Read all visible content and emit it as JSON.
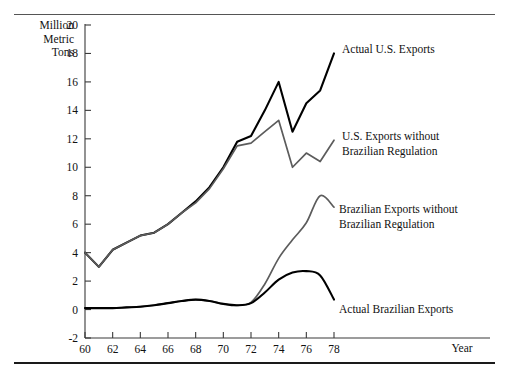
{
  "chart_data": {
    "type": "line",
    "title": "",
    "xlabel": "Year",
    "ylabel": "Million Metric Tons",
    "ylabel_lines": [
      "Million",
      "Metric",
      "Tons"
    ],
    "xlim": [
      60,
      78
    ],
    "ylim": [
      -2,
      20
    ],
    "xticks": [
      60,
      62,
      64,
      66,
      68,
      70,
      72,
      74,
      76,
      78
    ],
    "yticks": [
      -2,
      0,
      2,
      4,
      6,
      8,
      10,
      12,
      14,
      16,
      18,
      20
    ],
    "xtick_labels": [
      "60",
      "62",
      "64",
      "66",
      "68",
      "70",
      "72",
      "74",
      "76",
      "78"
    ],
    "ytick_labels": [
      "-2",
      "0",
      "2",
      "4",
      "6",
      "8",
      "10",
      "12",
      "14",
      "16",
      "18",
      "20"
    ],
    "grid": false,
    "legend_position": "inline-annotations",
    "x": [
      60,
      61,
      62,
      63,
      64,
      65,
      66,
      67,
      68,
      69,
      70,
      71,
      72,
      73,
      74,
      75,
      76,
      77,
      78
    ],
    "series": [
      {
        "name": "Actual U.S. Exports",
        "color": "#000000",
        "style": "solid",
        "width": 2.1,
        "values": [
          4.0,
          3.0,
          4.2,
          4.7,
          5.2,
          5.4,
          6.0,
          6.8,
          7.6,
          8.6,
          10.0,
          11.8,
          12.2,
          14.0,
          16.0,
          12.5,
          14.5,
          15.4,
          18.0
        ]
      },
      {
        "name": "U.S. Exports without Brazilian Regulation",
        "color": "#5c5c5c",
        "style": "solid",
        "width": 1.7,
        "values": [
          4.0,
          3.0,
          4.2,
          4.7,
          5.2,
          5.4,
          6.0,
          6.8,
          7.5,
          8.5,
          9.9,
          11.5,
          11.7,
          12.5,
          13.3,
          10.0,
          11.0,
          10.4,
          11.9
        ]
      },
      {
        "name": "Brazilian Exports without Brazilian Regulation",
        "color": "#5c5c5c",
        "style": "solid",
        "width": 1.7,
        "values": [
          0.1,
          0.1,
          0.1,
          0.15,
          0.2,
          0.3,
          0.45,
          0.6,
          0.7,
          0.6,
          0.4,
          0.3,
          0.5,
          1.8,
          3.6,
          4.9,
          6.1,
          8.0,
          7.2
        ]
      },
      {
        "name": "Actual Brazilian Exports",
        "color": "#000000",
        "style": "solid",
        "width": 2.1,
        "values": [
          0.1,
          0.1,
          0.1,
          0.15,
          0.2,
          0.3,
          0.45,
          0.6,
          0.7,
          0.6,
          0.4,
          0.3,
          0.45,
          1.2,
          2.1,
          2.6,
          2.7,
          2.4,
          0.7
        ]
      }
    ],
    "annotations": [
      {
        "name": "actual-us-exports",
        "lines": [
          "Actual U.S. Exports"
        ],
        "x_px": 342,
        "y_px": 53
      },
      {
        "name": "us-exports-without-regulation",
        "lines": [
          "U.S. Exports without",
          "Brazilian Regulation"
        ],
        "x_px": 342,
        "y_px": 140
      },
      {
        "name": "brazilian-exports-without-regulation",
        "lines": [
          "Brazilian Exports without",
          "Brazilian Regulation"
        ],
        "x_px": 339,
        "y_px": 213
      },
      {
        "name": "actual-brazilian-exports",
        "lines": [
          "Actual Brazilian Exports"
        ],
        "x_px": 339,
        "y_px": 313
      }
    ]
  }
}
